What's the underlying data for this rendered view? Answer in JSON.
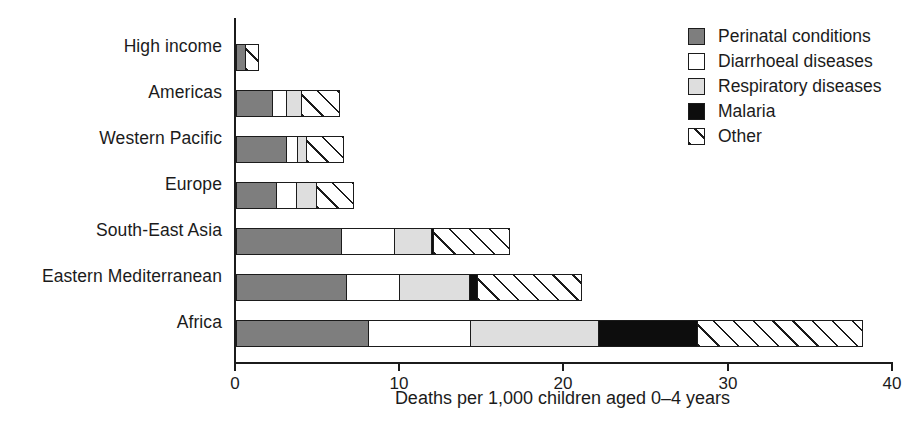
{
  "chart_data": {
    "type": "bar",
    "orientation": "horizontal",
    "stacked": true,
    "title": "",
    "xlabel": "Deaths per 1,000 children aged 0–4 years",
    "ylabel": "",
    "xlim": [
      0,
      40
    ],
    "xticks": [
      0,
      10,
      20,
      30,
      40
    ],
    "xtick_labels": [
      "0",
      "10",
      "20",
      "30",
      "40"
    ],
    "grid": false,
    "legend_position": "top-right",
    "categories": [
      "High income",
      "Americas",
      "Western Pacific",
      "Europe",
      "South-East Asia",
      "Eastern Mediterranean",
      "Africa"
    ],
    "series": [
      {
        "name": "Perinatal conditions",
        "color": "#7e7e7e",
        "pattern": "solid",
        "values": [
          0.6,
          2.3,
          3.1,
          2.5,
          6.5,
          6.8,
          8.1
        ]
      },
      {
        "name": "Diarrhoeal diseases",
        "color": "#ffffff",
        "pattern": "solid",
        "values": [
          0.0,
          0.9,
          0.8,
          1.3,
          3.3,
          3.3,
          6.3
        ]
      },
      {
        "name": "Respiratory diseases",
        "color": "#dedede",
        "pattern": "solid",
        "values": [
          0.0,
          1.0,
          0.6,
          1.3,
          2.3,
          4.3,
          7.9
        ]
      },
      {
        "name": "Malaria",
        "color": "#0d0d0d",
        "pattern": "solid",
        "values": [
          0.0,
          0.0,
          0.0,
          0.0,
          0.2,
          0.6,
          6.1
        ]
      },
      {
        "name": "Other",
        "color": "#ffffff",
        "pattern": "diagonal-hatch",
        "values": [
          0.9,
          2.4,
          2.3,
          2.3,
          4.7,
          6.4,
          10.1
        ]
      }
    ],
    "totals": [
      1.5,
      6.6,
      6.8,
      7.4,
      17.0,
      21.4,
      38.5
    ]
  },
  "axes": {
    "x_title": "Deaths per 1,000 children aged 0–4 years",
    "x_tick_labels": [
      "0",
      "10",
      "20",
      "30",
      "40"
    ],
    "y_tick_labels": [
      "High income",
      "Americas",
      "Western Pacific",
      "Europe",
      "South-East Asia",
      "Eastern Mediterranean",
      "Africa"
    ]
  },
  "legend": {
    "items": [
      {
        "label": "Perinatal conditions",
        "swatch": "mid-gray-swatch"
      },
      {
        "label": "Diarrhoeal diseases",
        "swatch": "white-swatch"
      },
      {
        "label": "Respiratory diseases",
        "swatch": "light-gray-swatch"
      },
      {
        "label": "Malaria",
        "swatch": "black-swatch"
      },
      {
        "label": "Other",
        "swatch": "hatched-swatch"
      }
    ]
  },
  "colors": {
    "perinatal": "#7e7e7e",
    "diarrhoeal": "#ffffff",
    "respiratory": "#dedede",
    "malaria": "#0d0d0d",
    "other": "#ffffff",
    "ink": "#1b1b1b",
    "background": "#ffffff"
  }
}
